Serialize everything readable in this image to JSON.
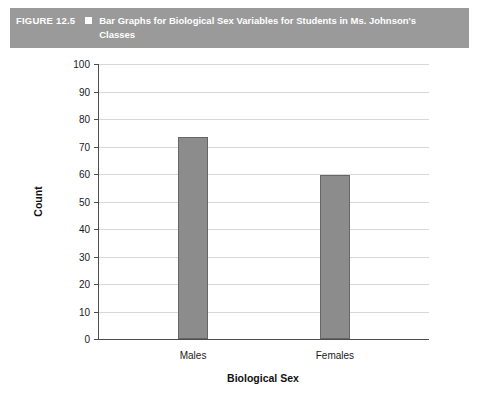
{
  "figure": {
    "label": "FIGURE 12.5",
    "bullet_icon": "square-bullet-icon",
    "title": "Bar Graphs for Biological Sex Variables for Students in Ms. Johnson's Classes"
  },
  "colors": {
    "header_band": "#9a9a9a",
    "bar_fill": "#8c8c8c",
    "bar_stroke": "#666666",
    "gridline": "#d8d8d8",
    "axis": "#4d4d4d"
  },
  "chart_data": {
    "type": "bar",
    "title": "Bar Graphs for Biological Sex Variables for Students in Ms. Johnson's Classes",
    "categories": [
      "Males",
      "Females"
    ],
    "values": [
      73.5,
      59.5
    ],
    "xlabel": "Biological Sex",
    "ylabel": "Count",
    "ylim": [
      0,
      100
    ],
    "ytick_labels": [
      "0",
      "10",
      "20",
      "30",
      "40",
      "50",
      "60",
      "70",
      "80",
      "90",
      "100"
    ],
    "ytick_values": [
      0,
      10,
      20,
      30,
      40,
      50,
      60,
      70,
      80,
      90,
      100
    ],
    "grid": true,
    "grid_axis": "y",
    "legend": null,
    "legend_position": "none"
  }
}
